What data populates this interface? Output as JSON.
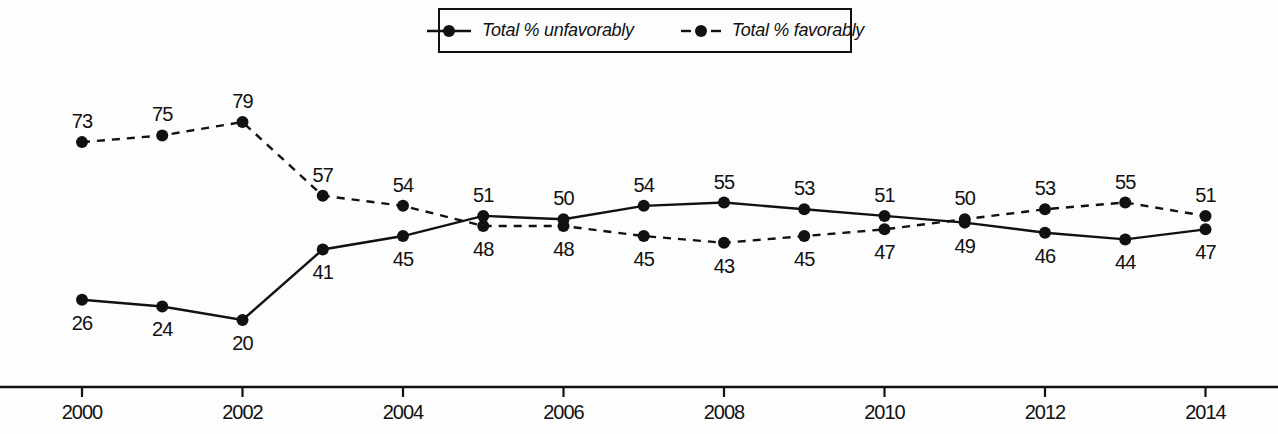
{
  "chart_data": {
    "type": "line",
    "title": "",
    "xlabel": "",
    "ylabel": "",
    "x": [
      2000,
      2001,
      2002,
      2003,
      2004,
      2005,
      2006,
      2007,
      2008,
      2009,
      2010,
      2011,
      2012,
      2013,
      2014
    ],
    "x_tick_labels": [
      "2000",
      "2002",
      "2004",
      "2006",
      "2008",
      "2010",
      "2012",
      "2014"
    ],
    "ylim": [
      0,
      110
    ],
    "grid": false,
    "legend_position": "top-center",
    "data_labels": true,
    "line_color": "#111111",
    "background_color": "#fdfdfd",
    "series": [
      {
        "name": "Total % unfavorably",
        "legend_label": "Total % unfavorably",
        "style": "solid",
        "values": [
          26,
          24,
          20,
          41,
          45,
          51,
          50,
          54,
          55,
          53,
          51,
          49,
          46,
          44,
          47
        ]
      },
      {
        "name": "Total % favorably",
        "legend_label": "Total % favorably",
        "style": "dashed",
        "values": [
          73,
          75,
          79,
          57,
          54,
          48,
          48,
          45,
          43,
          45,
          47,
          50,
          53,
          55,
          51
        ]
      }
    ]
  }
}
